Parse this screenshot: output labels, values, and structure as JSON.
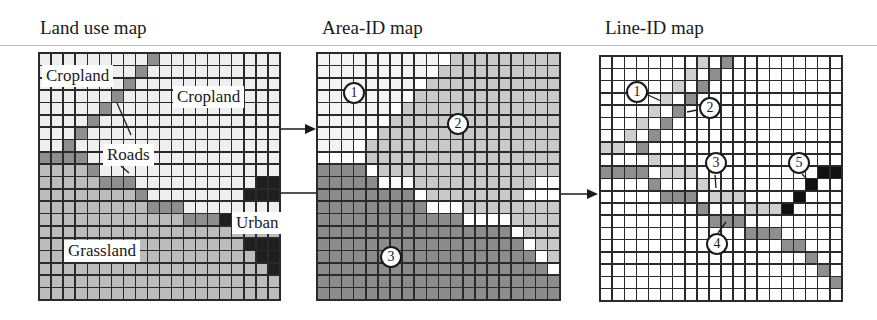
{
  "panels": {
    "land_use": {
      "title": "Land use map",
      "labels": {
        "cropland_1": "Cropland",
        "cropland_2": "Cropland",
        "roads": "Roads",
        "urban": "Urban",
        "grassland": "Grassland"
      },
      "legend_codes": {
        "C": "Cropland",
        "G": "Grassland",
        "R": "Road",
        "U": "Urban"
      },
      "colors": {
        "C": "#efefef",
        "G": "#bcbcbc",
        "R": "#8e8e8e",
        "U": "#1e1e1e"
      },
      "rows": [
        "CCCCCCCCCRCCCCCCCCCC",
        "CCCCCCCCRCCCCCCCCCCC",
        "CCCCCCCRCCCCCCCCCCCC",
        "CCCCCCRCCCCCCCCCCCCC",
        "CCCCCRCCCCCCCCCCCCCC",
        "CCCCRCCCCCCCCCCCCCCC",
        "CCCRCCCCCCCCCCCCCCCC",
        "CCRCCCCCCCCCCCCCCCCC",
        "RRRRCCCCCCCCCCCCCCCC",
        "GGGGRCCCCCCCCCCCCCCC",
        "GGGGGRRRCCCCCCCCCCUU",
        "GGGGGGGGRCCCCCCCCUUU",
        "GGGGGGGGGRRRCCCCCCCC",
        "GGGGGGGGGGGGRRRUCCCC",
        "GGGGGGGGGGGGGGGGGGGG",
        "GGGGGGGGGGGGGGGGGUUU",
        "GGGGGGGGGGGGGGGGGGUU",
        "GGGGGGGGGGGGGGGGGGGU",
        "GGGGGGGGGGGGGGGGGGGG",
        "GGGGGGGGGGGGGGGGGGGG"
      ]
    },
    "area_id": {
      "title": "Area-ID map",
      "badges": {
        "a1": "1",
        "a2": "2",
        "a3": "3"
      },
      "legend_codes": {
        "1": "Area 1",
        "2": "Area 2",
        "3": "Area 3",
        "0": "Non-area (road/urban)"
      },
      "colors": {
        "1": "#f4f4f4",
        "2": "#c9c9c9",
        "3": "#8c8c8c",
        "0": "#ffffff"
      },
      "rows": [
        "11111111110222222222",
        "11111111102222222222",
        "11111111022222222222",
        "11111110222222222222",
        "11111102222222222222",
        "11111022222222222222",
        "11110222222222222222",
        "11102222222222222222",
        "00002222222222222222",
        "33330222222222222222",
        "33333000222222222200",
        "33333333022222222000",
        "33333333300022222222",
        "33333333333300002222",
        "33333333333333330222",
        "33333333333333333022",
        "33333333333333333302",
        "33333333333333333330",
        "33333333333333333333",
        "33333333333333333333"
      ]
    },
    "line_id": {
      "title": "Line-ID map",
      "badges": {
        "l1": "1",
        "l2": "2",
        "l3": "3",
        "l4": "4",
        "l5": "5"
      },
      "legend_codes": {
        "0": "Background",
        "a": "Line 1",
        "b": "Line 2",
        "c": "Line 3",
        "d": "Line 4",
        "e": "Line 5"
      },
      "colors": {
        "0": "#ffffff",
        "a": "#cfcfcf",
        "b": "#8f8f8f",
        "c": "#cfcfcf",
        "d": "#8f8f8f",
        "e": "#111111"
      },
      "rows": [
        "00000000a0b000000000",
        "0000000a0b0000000000",
        "000000a0b00000000000",
        "00000a0b000000000000",
        "0000a0b0000000000000",
        "000a0b00000000000000",
        "00a0b000000000000000",
        "aa0b0000000000000000",
        "0000c000000000000000",
        "bbbb0ccc0000000000ee",
        "0000b000c00000000e00",
        "00000ddd0ccc0000e000",
        "00000000d000ccce0000",
        "000000000ddd00000000",
        "000000000000ddd00000",
        "000000000000000dd000",
        "00000000000000000d00",
        "000000000000000000d0",
        "0000000000000000000d",
        "00000000000000000000"
      ]
    }
  },
  "arrows": [
    {
      "from": "Land use map",
      "to": "Area-ID map"
    },
    {
      "from": "Land use map",
      "to": "Line-ID map"
    }
  ]
}
